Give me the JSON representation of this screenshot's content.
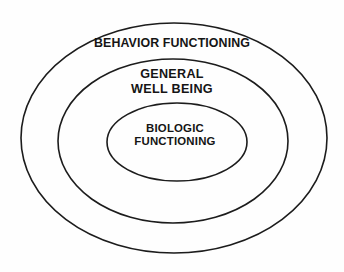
{
  "figure": {
    "type": "nested-ellipse-diagram",
    "background_color": "#fefefe",
    "stroke_color": "#1c1c1c",
    "text_color": "#151515"
  },
  "rings": [
    {
      "id": "outer",
      "name": "behavior-functioning",
      "label_lines": [
        "BEHAVIOR FUNCTIONING"
      ],
      "label_single": "BEHAVIOR FUNCTIONING",
      "level": 1,
      "geometry": {
        "cx": 174,
        "cy": 138,
        "rx": 153,
        "ry": 115
      }
    },
    {
      "id": "middle",
      "name": "general-well-being",
      "label_lines": [
        "GENERAL",
        "WELL BEING"
      ],
      "label_single": "GENERAL WELL BEING",
      "level": 2,
      "geometry": {
        "cx": 173,
        "cy": 141,
        "rx": 115,
        "ry": 82
      }
    },
    {
      "id": "inner",
      "name": "biologic-functioning",
      "label_lines": [
        "BIOLOGIC",
        "FUNCTIONING"
      ],
      "label_single": "BIOLOGIC FUNCTIONING",
      "level": 3,
      "geometry": {
        "cx": 177,
        "cy": 142,
        "rx": 70,
        "ry": 39
      }
    }
  ],
  "labels": {
    "outer_line1": "BEHAVIOR FUNCTIONING",
    "middle_line1": "GENERAL",
    "middle_line2": "WELL BEING",
    "inner_line1": "BIOLOGIC",
    "inner_line2": "FUNCTIONING"
  }
}
